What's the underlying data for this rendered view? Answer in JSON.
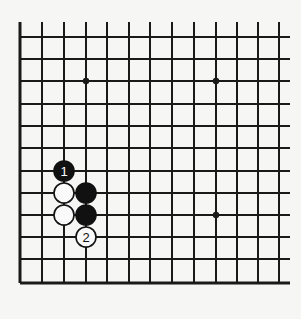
{
  "diagram": {
    "type": "go-board-fragment",
    "background": "#f6f6f4",
    "line_color": "#1a1a1a",
    "grid": {
      "columns_x": [
        20,
        42,
        64,
        86,
        107,
        129,
        150,
        172,
        194,
        216,
        237,
        258,
        279
      ],
      "rows_y": [
        37,
        59,
        81,
        104,
        126,
        148,
        171,
        193,
        215,
        237,
        259,
        283
      ],
      "top_extent_y": 22,
      "right_extent_x": 290,
      "edges": [
        "left",
        "bottom"
      ]
    },
    "star_points": [
      {
        "col": 3,
        "row": 2
      },
      {
        "col": 9,
        "row": 2
      },
      {
        "col": 9,
        "row": 8
      }
    ],
    "stones": [
      {
        "color": "black",
        "col": 2,
        "row": 6,
        "label": "1"
      },
      {
        "color": "white",
        "col": 2,
        "row": 7,
        "label": ""
      },
      {
        "color": "black",
        "col": 3,
        "row": 7,
        "label": ""
      },
      {
        "color": "white",
        "col": 2,
        "row": 8,
        "label": ""
      },
      {
        "color": "black",
        "col": 3,
        "row": 8,
        "label": ""
      },
      {
        "color": "white",
        "col": 3,
        "row": 9,
        "label": "2"
      }
    ],
    "stone_radius": 10
  }
}
